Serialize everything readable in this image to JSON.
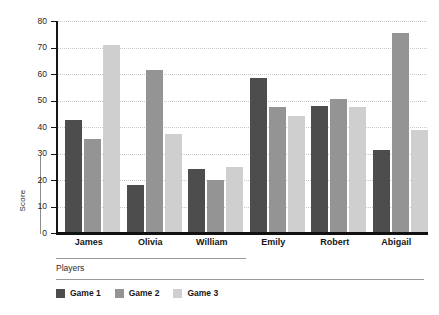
{
  "chart_data": {
    "type": "bar",
    "title": "",
    "subtitle": "",
    "xlabel": "Players",
    "ylabel": "Score",
    "ylim": [
      0,
      80
    ],
    "ytick_step": 10,
    "yticks": [
      0,
      10,
      20,
      30,
      40,
      50,
      60,
      70,
      80
    ],
    "ytick_labels": [
      "0",
      "10",
      "20",
      "30",
      "40",
      "50",
      "60",
      "70",
      "80"
    ],
    "grid": true,
    "grid_axis": "y",
    "grid_style": "dotted",
    "legend_position": "bottom-left",
    "orientation": "vertical",
    "grouping": "clustered",
    "categories": [
      "James",
      "Olivia",
      "William",
      "Emily",
      "Robert",
      "Abigail"
    ],
    "series": [
      {
        "name": "Game 1",
        "color": "#4d4d4d",
        "values": [
          42.5,
          18,
          24,
          58.5,
          48,
          31.5
        ]
      },
      {
        "name": "Game 2",
        "color": "#949494",
        "values": [
          35.5,
          61.5,
          20,
          47.5,
          50.5,
          75.5
        ]
      },
      {
        "name": "Game 3",
        "color": "#cfcfcf",
        "values": [
          71,
          37.5,
          25,
          44,
          47.5,
          39
        ]
      }
    ]
  },
  "axis": {
    "y_label_text": "Score",
    "x_label_text": "Players"
  },
  "legend": {
    "items": [
      {
        "label": "Game 1",
        "color": "#4d4d4d"
      },
      {
        "label": "Game 2",
        "color": "#949494"
      },
      {
        "label": "Game 3",
        "color": "#cfcfcf"
      }
    ]
  },
  "colors": {
    "series_1": "#4d4d4d",
    "series_2": "#949494",
    "series_3": "#cfcfcf",
    "axis": "#161616",
    "grid": "#c9c9c9",
    "background": "#ffffff"
  }
}
